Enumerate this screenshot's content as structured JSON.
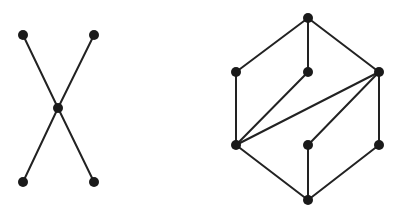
{
  "colors": {
    "background": "#ffffff",
    "edge": "#222222",
    "node": "#1a1a1a"
  },
  "node_radius": 5,
  "graphs": [
    {
      "name": "x-shaped-graph",
      "nodes": [
        {
          "id": "a",
          "x": 23,
          "y": 35
        },
        {
          "id": "b",
          "x": 94,
          "y": 35
        },
        {
          "id": "c",
          "x": 58,
          "y": 108
        },
        {
          "id": "d",
          "x": 23,
          "y": 182
        },
        {
          "id": "e",
          "x": 94,
          "y": 182
        }
      ],
      "edges": [
        [
          "a",
          "c"
        ],
        [
          "b",
          "c"
        ],
        [
          "c",
          "d"
        ],
        [
          "c",
          "e"
        ]
      ]
    },
    {
      "name": "hexagonal-graph",
      "nodes": [
        {
          "id": "top",
          "x": 308,
          "y": 18
        },
        {
          "id": "ml",
          "x": 236,
          "y": 72
        },
        {
          "id": "mc",
          "x": 308,
          "y": 72
        },
        {
          "id": "mr",
          "x": 379,
          "y": 72
        },
        {
          "id": "ll",
          "x": 236,
          "y": 145
        },
        {
          "id": "lc",
          "x": 308,
          "y": 145
        },
        {
          "id": "lr",
          "x": 379,
          "y": 145
        },
        {
          "id": "bot",
          "x": 308,
          "y": 200
        }
      ],
      "edges": [
        [
          "top",
          "ml"
        ],
        [
          "top",
          "mc"
        ],
        [
          "top",
          "mr"
        ],
        [
          "ml",
          "ll"
        ],
        [
          "mc",
          "ll"
        ],
        [
          "mr",
          "ll"
        ],
        [
          "mr",
          "lc"
        ],
        [
          "mr",
          "lr"
        ],
        [
          "ll",
          "bot"
        ],
        [
          "lc",
          "bot"
        ],
        [
          "lr",
          "bot"
        ]
      ]
    }
  ]
}
